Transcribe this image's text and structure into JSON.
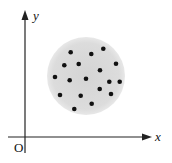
{
  "diagram": {
    "axes": {
      "x_label": "x",
      "y_label": "y",
      "origin_label": "O"
    },
    "region": {
      "shape": "circle",
      "center": [
        86,
        76
      ],
      "radius": 39,
      "fill": "#d9d9d9"
    },
    "points": [
      [
        70.7,
        52.3
      ],
      [
        91.3,
        54
      ],
      [
        103.3,
        48.7
      ],
      [
        64.3,
        65.3
      ],
      [
        78.7,
        64
      ],
      [
        116,
        63.7
      ],
      [
        100,
        70.3
      ],
      [
        55,
        77
      ],
      [
        69.7,
        80.3
      ],
      [
        86,
        78.7
      ],
      [
        109.3,
        81.7
      ],
      [
        119.7,
        81.7
      ],
      [
        99.7,
        89
      ],
      [
        60,
        95
      ],
      [
        80.7,
        95.7
      ],
      [
        111,
        94
      ],
      [
        91.7,
        103.7
      ],
      [
        74.3,
        109
      ]
    ],
    "point_color": "#111111"
  }
}
